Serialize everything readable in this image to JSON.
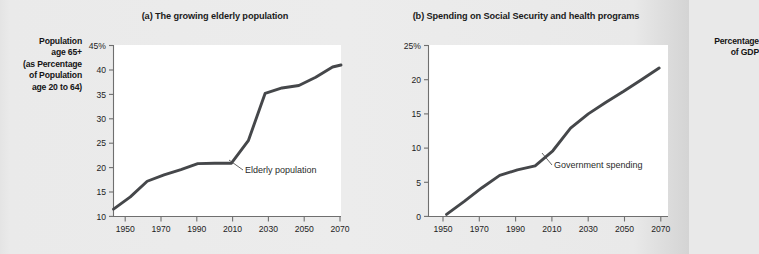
{
  "figure": {
    "background_color": "#e9e9e9",
    "plot_background_color": "#ffffff",
    "line_color": "#45474a",
    "axis_color": "#6f6f6f"
  },
  "panel_a": {
    "title": "(a) The growing elderly population",
    "ylabel_lines": [
      "Population",
      "age 65+",
      "(as Percentage",
      "of Population",
      "age 20 to 64)"
    ],
    "ylabel_text": "Population age 65+ (as Percentage of Population age 20 to 64)",
    "annotation": "Elderly population",
    "yticks": [
      "45%",
      "40",
      "35",
      "30",
      "25",
      "20",
      "15",
      "10"
    ],
    "xticks": [
      "1950",
      "1970",
      "1990",
      "2010",
      "2030",
      "2050",
      "2070"
    ]
  },
  "panel_b": {
    "title": "(b) Spending on Social Security and health programs",
    "ylabel_lines": [
      "Percentage",
      "of GDP"
    ],
    "ylabel_text": "Percentage of GDP",
    "annotation": "Government spending",
    "yticks": [
      "25%",
      "20",
      "15",
      "10",
      "5",
      "0"
    ],
    "xticks": [
      "1950",
      "1970",
      "1990",
      "2010",
      "2030",
      "2050",
      "2070"
    ]
  },
  "chart_data": [
    {
      "type": "line",
      "title": "(a) The growing elderly population",
      "xlabel": "",
      "ylabel": "Population age 65+ (as Percentage of Population age 20 to 64)",
      "ylim": [
        10,
        45
      ],
      "xlim": [
        1940,
        2075
      ],
      "grid": false,
      "legend": "none",
      "ytick_values": [
        45,
        40,
        35,
        30,
        25,
        20,
        15,
        10
      ],
      "xtick_values": [
        1950,
        1970,
        1990,
        2010,
        2030,
        2050,
        2070
      ],
      "annotations": [
        {
          "text": "Elderly population",
          "points_to_year": 2018,
          "points_to_value": 25.5
        }
      ],
      "series": [
        {
          "name": "Elderly population",
          "x": [
            1940,
            1950,
            1960,
            1970,
            1980,
            1990,
            2000,
            2010,
            2020,
            2030,
            2040,
            2050,
            2060,
            2070,
            2075
          ],
          "y": [
            11.5,
            14.0,
            17.2,
            18.5,
            19.6,
            20.8,
            20.9,
            20.9,
            25.5,
            35.2,
            36.3,
            36.8,
            38.5,
            40.6,
            41.0
          ]
        }
      ]
    },
    {
      "type": "line",
      "title": "(b) Spending on Social Security and health programs",
      "xlabel": "",
      "ylabel": "Percentage of GDP",
      "ylim": [
        0,
        25
      ],
      "xlim": [
        1948,
        2075
      ],
      "grid": false,
      "legend": "none",
      "ytick_values": [
        25,
        20,
        15,
        10,
        5,
        0
      ],
      "xtick_values": [
        1950,
        1970,
        1990,
        2010,
        2030,
        2050,
        2070
      ],
      "annotations": [
        {
          "text": "Government spending",
          "points_to_year": 2009,
          "points_to_value": 9.6
        }
      ],
      "series": [
        {
          "name": "Government spending",
          "x": [
            1950,
            1960,
            1970,
            1980,
            1990,
            2000,
            2010,
            2020,
            2030,
            2040,
            2050,
            2060,
            2070
          ],
          "y": [
            0.3,
            2.2,
            4.2,
            6.0,
            6.8,
            7.4,
            9.6,
            12.9,
            15.0,
            16.7,
            18.3,
            20.0,
            21.7
          ]
        }
      ]
    }
  ]
}
